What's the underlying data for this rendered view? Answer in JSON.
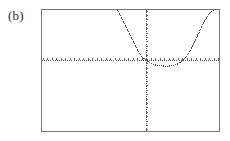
{
  "figure": {
    "panel_label": "(b)",
    "caption": "",
    "background_color": "#ffffff"
  },
  "chart_data": {
    "type": "line",
    "title": "",
    "subtitle": "",
    "xlabel": "",
    "ylabel": "",
    "style": "graphing-calculator-dotted",
    "grid": false,
    "legend": null,
    "legend_position": "none",
    "frame": {
      "visible": true,
      "color": "#6e6e6e",
      "left_px": 41,
      "top_px": 9,
      "right_px": 220,
      "bottom_px": 132
    },
    "axes": {
      "x_axis": {
        "visible": true,
        "style": "dotted-with-ticks",
        "color": "#555555",
        "y_pixel": 60,
        "tick_count": 40,
        "tick_spacing_px": 4.5,
        "tick_labels": [],
        "range": [
          -10,
          10
        ]
      },
      "y_axis": {
        "visible": true,
        "style": "dotted-with-ticks",
        "color": "#555555",
        "x_pixel": 146,
        "tick_count": 28,
        "tick_spacing_px": 4.4,
        "tick_labels": [],
        "range": [
          -10,
          4
        ]
      },
      "origin_px": {
        "x": 146,
        "y": 60
      }
    },
    "xlim": [
      -10,
      10
    ],
    "ylim": [
      -10,
      4
    ],
    "series": [
      {
        "name": "curve",
        "color": "#4a4a4a",
        "marker": "dot",
        "linestyle": "dotted",
        "description": "steep descending left branch crossing the x-axis just left of the y-axis, shallow minimum below the axis to the right of the origin, then steep rise to upper right",
        "points_px": [
          [
            117,
            9
          ],
          [
            119,
            13
          ],
          [
            121,
            17
          ],
          [
            123,
            21
          ],
          [
            125,
            25
          ],
          [
            127,
            29
          ],
          [
            129,
            33
          ],
          [
            131,
            37
          ],
          [
            133,
            41
          ],
          [
            135,
            45
          ],
          [
            137,
            49
          ],
          [
            139,
            53
          ],
          [
            141,
            56
          ],
          [
            143,
            58
          ],
          [
            145,
            59.5
          ],
          [
            147,
            61
          ],
          [
            149,
            62.5
          ],
          [
            151,
            63.5
          ],
          [
            153,
            64.3
          ],
          [
            155,
            64.9
          ],
          [
            157,
            65.3
          ],
          [
            159,
            65.6
          ],
          [
            161,
            65.8
          ],
          [
            163,
            65.9
          ],
          [
            165,
            66.0
          ],
          [
            167,
            66.0
          ],
          [
            169,
            65.9
          ],
          [
            171,
            65.7
          ],
          [
            173,
            65.3
          ],
          [
            175,
            64.7
          ],
          [
            177,
            63.9
          ],
          [
            179,
            62.8
          ],
          [
            181,
            61.4
          ],
          [
            183,
            59.6
          ],
          [
            185,
            57.4
          ],
          [
            187,
            54.8
          ],
          [
            189,
            51.8
          ],
          [
            191,
            48.4
          ],
          [
            193,
            44.6
          ],
          [
            195,
            40.6
          ],
          [
            197,
            36.4
          ],
          [
            199,
            32.0
          ],
          [
            201,
            27.6
          ],
          [
            203,
            23.4
          ],
          [
            205,
            19.6
          ],
          [
            207,
            16.2
          ],
          [
            209,
            13.4
          ],
          [
            211,
            11.4
          ],
          [
            213,
            10.1
          ],
          [
            215,
            9.3
          ],
          [
            217,
            9.0
          ]
        ]
      }
    ],
    "annotations": []
  }
}
